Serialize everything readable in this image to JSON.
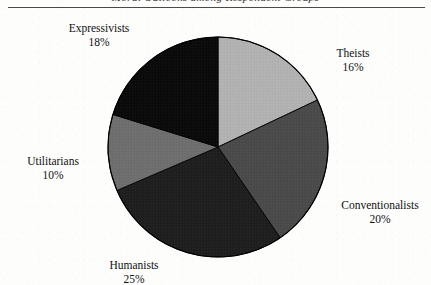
{
  "page": {
    "running_head": "Moral Outlooks among Respondent Groups",
    "background_color": "#fdfdfc",
    "rule_color": "#4a4a4a"
  },
  "chart_data": {
    "type": "pie",
    "title": "",
    "categories": [
      "Theists",
      "Conventionalists",
      "Humanists",
      "Utilitarians",
      "Expressivists"
    ],
    "values": [
      16,
      20,
      25,
      10,
      18
    ],
    "value_suffix": "%",
    "start_angle_deg": 0,
    "direction": "clockwise",
    "legend": "none",
    "labels_position": "outside",
    "slices": [
      {
        "name": "Theists",
        "value": 16,
        "label": "Theists",
        "percent_label": "16%",
        "color": "#b2b2b2",
        "start_deg": 0.0,
        "end_deg": 57.6
      },
      {
        "name": "Conventionalists",
        "value": 20,
        "label": "Conventionalists",
        "percent_label": "20%",
        "color": "#4a4a4a",
        "start_deg": 57.6,
        "end_deg": 129.6
      },
      {
        "name": "Humanists",
        "value": 25,
        "label": "Humanists",
        "percent_label": "25%",
        "color": "#1e1e1e",
        "start_deg": 129.6,
        "end_deg": 219.6
      },
      {
        "name": "Utilitarians",
        "value": 10,
        "label": "Utilitarians",
        "percent_label": "10%",
        "color": "#6e6e6e",
        "start_deg": 219.6,
        "end_deg": 255.6
      },
      {
        "name": "Expressivists",
        "value": 18,
        "label": "Expressivists",
        "percent_label": "18%",
        "color": "#0a0a0a",
        "start_deg": 255.6,
        "end_deg": 320.4
      }
    ],
    "geometry": {
      "cx": 218,
      "cy": 139,
      "r": 110
    },
    "outline_color": "#000000"
  }
}
